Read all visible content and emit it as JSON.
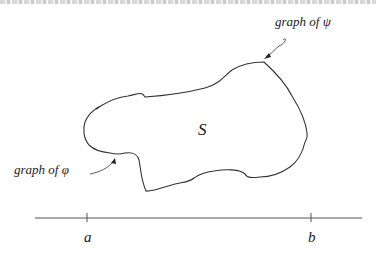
{
  "diagram": {
    "labels": {
      "psi": "graph of ψ",
      "phi": "graph of φ",
      "region": "S",
      "a": "a",
      "b": "b"
    },
    "colors": {
      "stroke": "#333333",
      "text": "#1a1a1a",
      "background": "#ffffff"
    },
    "axis": {
      "x1": 35,
      "x2": 362,
      "y": 218,
      "tick_a_x": 87,
      "tick_b_x": 311
    }
  }
}
